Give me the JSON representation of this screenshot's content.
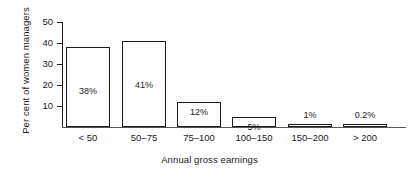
{
  "chart_data": {
    "type": "bar",
    "title": "",
    "xlabel": "Annual gross earnings",
    "ylabel": "Per cent of women managers",
    "categories": [
      "< 50",
      "50–75",
      "75–100",
      "100–150",
      "150–200",
      "> 200"
    ],
    "values": [
      38,
      41,
      12,
      5,
      1,
      0.2
    ],
    "data_labels": [
      "38%",
      "41%",
      "12%",
      "5%",
      "1%",
      "0.2%"
    ],
    "label_placement": [
      "inside",
      "inside",
      "inside",
      "inside",
      "outside",
      "outside"
    ],
    "ylim": [
      0,
      50
    ],
    "yticks": [
      10,
      20,
      30,
      40,
      50
    ],
    "ytick_labels": [
      "10",
      "20",
      "30",
      "40",
      "50"
    ],
    "grid": false,
    "legend": null,
    "bar_fill": "#ffffff",
    "bar_stroke": "#1a1a1a"
  }
}
